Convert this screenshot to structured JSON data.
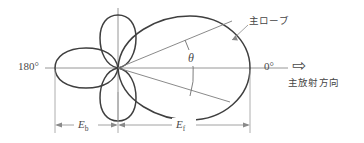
{
  "figure": {
    "kind": "antenna-radiation-pattern-diagram",
    "labels": {
      "angle_left": "180°",
      "angle_right": "0°",
      "beamwidth_symbol": "θ",
      "main_lobe": "主ローブ",
      "main_radiation_direction": "主放射方向",
      "dim_back": "E",
      "dim_back_sub": "b",
      "dim_front": "E",
      "dim_front_sub": "f",
      "direction_arrow_glyph": "⇨"
    },
    "colors": {
      "lobe_stroke": "#3f3f3f",
      "axis_stroke": "#8a8a8a",
      "dimension_stroke": "#8a8a8a",
      "leader_stroke": "#8a8a8a",
      "text": "#454545",
      "background": "#ffffff"
    },
    "geometry": {
      "origin_x": 118,
      "origin_y": 68,
      "main_lobe_tip_x": 250,
      "back_lobe_end_x": 55,
      "axis_left_x": 45,
      "axis_right_x": 288,
      "vertical_axis_top_y": 8,
      "vertical_axis_bottom_y": 120,
      "dimension_line_y": 125,
      "beamwidth_degrees": 30
    }
  }
}
